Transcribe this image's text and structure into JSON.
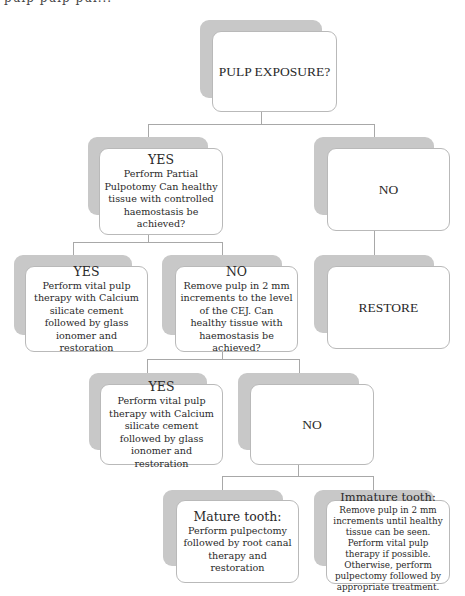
{
  "header_fragment": "pulp pulp pul...",
  "nodes": {
    "root": {
      "title": "PULP EXPOSURE?",
      "body": ""
    },
    "yes1": {
      "title": "YES",
      "body": "Perform Partial Pulpotomy Can healthy tissue with controlled haemostasis be achieved?"
    },
    "no1": {
      "title": "NO",
      "body": ""
    },
    "restore": {
      "title": "RESTORE",
      "body": ""
    },
    "yes2": {
      "title": "YES",
      "body": "Perform vital pulp therapy with Calcium silicate cement followed by glass ionomer and restoration"
    },
    "no2": {
      "title": "NO",
      "body": "Remove pulp in 2 mm increments to the level of the CEJ. Can healthy tissue with haemostasis be achieved?"
    },
    "yes3": {
      "title": "YES",
      "body": "Perform vital pulp therapy with Calcium silicate cement followed by glass ionomer and restoration"
    },
    "no3": {
      "title": "NO",
      "body": ""
    },
    "mature": {
      "title": "Mature tooth:",
      "body": "Perform pulpectomy followed by root canal therapy and restoration"
    },
    "immature": {
      "title": "Immature tooth:",
      "body": "Remove pulp in 2 mm increments until healthy tissue can be seen. Perform vital pulp therapy if possible. Otherwise, perform pulpectomy followed by appropriate treatment."
    }
  },
  "colors": {
    "shadow": "#c8c8c8",
    "border": "#b9b9b9",
    "connector": "#a8a8a8"
  }
}
